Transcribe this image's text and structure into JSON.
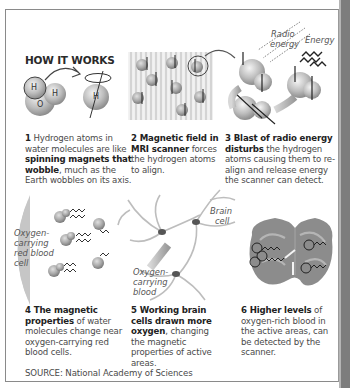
{
  "title": "HOW IT WORKS",
  "steps": [
    {
      "num": "1",
      "pre": "Hydrogen atoms in water molecules are like",
      "bold": "spinning magnets that wobble",
      "post": ", much as the Earth wobbles on its axis.",
      "lines": [
        "1 Hydrogen atoms in",
        "water molecules are like",
        "spinning magnets that",
        "wobble, much as the",
        "Earth wobbles on its axis."
      ]
    },
    {
      "num": "2",
      "bold": "Magnetic field in MRI scanner",
      "post": "forces the hydrogen atoms to align.",
      "lines": [
        "2 Magnetic field",
        "in MRI scanner",
        "forces the hydrogen",
        "atoms to align."
      ]
    },
    {
      "num": "3",
      "bold": "Blast of radio energy disturbs",
      "post": "the hydrogen atoms causing them to re-align and release energy the scanner can detect.",
      "lines": [
        "3 Blast of radio energy",
        "disturbs the hydrogen",
        "atoms causing them to",
        "re-align and release energy",
        "the scanner can detect."
      ]
    },
    {
      "num": "4",
      "bold": "The magnetic properties",
      "post": "of water molecules change near oxygen-carrying red blood cells.",
      "lines": [
        "4 The magnetic",
        "properties of water",
        "molecules change near",
        "oxygen-carrying red",
        "blood cells."
      ]
    },
    {
      "num": "5",
      "bold": "Working brain cells drawn more oxygen",
      "post": ", changing the magnetic properties of active areas.",
      "lines": [
        "5 Working brain",
        "cells drawn more",
        "oxygen, changing the",
        "magnetic properties",
        "of active areas."
      ]
    },
    {
      "num": "6",
      "bold": "Higher levels",
      "post": "of oxygen-rich blood in the active areas, can be detected by the scanner.",
      "lines": [
        "6 Higher levels",
        "of oxygen-rich blood",
        "in the active areas,",
        "can be detected by",
        "the scanner."
      ]
    }
  ],
  "labels": {
    "h1": "H",
    "h2": "H",
    "o": "O",
    "h_single": "H",
    "radio_energy_1": "Radio",
    "radio_energy_2": "energy",
    "energy": "Energy",
    "red_cell_1": "Oxygen-",
    "red_cell_2": "carrying",
    "red_cell_3": "red blood",
    "red_cell_4": "cell",
    "blood_1": "Oxygen-",
    "blood_2": "carrying",
    "blood_3": "blood",
    "brain_cell_1": "Brain",
    "brain_cell_2": "cell"
  },
  "source": "SOURCE: National Academy of Sciences"
}
